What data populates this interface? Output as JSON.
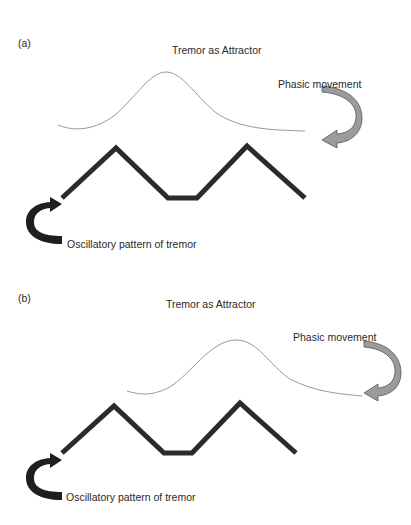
{
  "panels": [
    {
      "label": "(a)",
      "title": "Tremor as Attractor",
      "phasic_label": "Phasic movement",
      "oscillatory_label": "Oscillatory pattern of tremor",
      "curve": {
        "start": [
          58,
          125
        ],
        "peak": [
          166,
          72
        ],
        "end": [
          305,
          131
        ]
      },
      "zigzag": [
        [
          62,
          198
        ],
        [
          116,
          148
        ],
        [
          168,
          198
        ],
        [
          197,
          198
        ],
        [
          247,
          146
        ],
        [
          305,
          198
        ]
      ]
    },
    {
      "label": "(b)",
      "title": "Tremor as Attractor",
      "phasic_label": "Phasic movement",
      "oscillatory_label": "Oscillatory pattern of tremor",
      "curve": {
        "start": [
          127,
          129
        ],
        "peak": [
          236,
          78
        ],
        "end": [
          362,
          134
        ]
      },
      "zigzag": [
        [
          62,
          191
        ],
        [
          114,
          144
        ],
        [
          164,
          191
        ],
        [
          192,
          191
        ],
        [
          240,
          141
        ],
        [
          296,
          191
        ]
      ]
    }
  ],
  "colors": {
    "curve": "#9a9a9a",
    "zigzag": "#2b2b2b",
    "phasic_arrow_fill": "#9b9b9b",
    "phasic_arrow_stroke": "#555555",
    "tremor_arrow": "#1f1f1f"
  }
}
